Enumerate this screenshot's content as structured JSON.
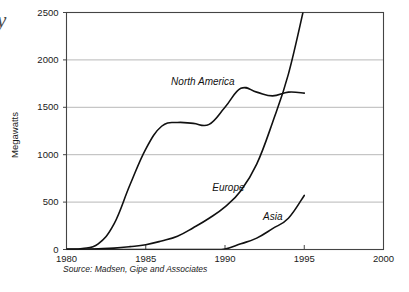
{
  "figure": {
    "edge_glyph": "y",
    "source_note": "Source: Madsen, Gipe and Associates"
  },
  "chart_data": {
    "type": "line",
    "title": "",
    "subtitle": "",
    "xlabel": "",
    "ylabel": "Megawatts",
    "xlim": [
      1980,
      2000
    ],
    "ylim": [
      0,
      2500
    ],
    "xticks": [
      1980,
      1985,
      1990,
      1995,
      2000
    ],
    "xtick_labels": [
      "1980",
      "1985",
      "1990",
      "1995",
      "2000"
    ],
    "yticks": [
      0,
      500,
      1000,
      1500,
      2000,
      2500
    ],
    "ytick_labels": [
      "0",
      "500",
      "1000",
      "1500",
      "2000",
      "2500"
    ],
    "grid": true,
    "grid_axis": "y",
    "legend": "inline-labels",
    "annotations": [
      {
        "text": "North America",
        "x": 1986.6,
        "y": 1760
      },
      {
        "text": "Europe",
        "x": 1989.2,
        "y": 640
      },
      {
        "text": "Asia",
        "x": 1992.4,
        "y": 330
      }
    ],
    "series": [
      {
        "name": "North America",
        "color": "#111111",
        "x": [
          1980,
          1981,
          1982,
          1983,
          1984,
          1985,
          1986,
          1987,
          1988,
          1989,
          1990,
          1991,
          1992,
          1993,
          1994,
          1995
        ],
        "values": [
          5,
          10,
          60,
          270,
          680,
          1060,
          1300,
          1340,
          1330,
          1320,
          1500,
          1700,
          1660,
          1620,
          1660,
          1650
        ]
      },
      {
        "name": "Europe",
        "color": "#111111",
        "x": [
          1980,
          1981,
          1982,
          1983,
          1984,
          1985,
          1986,
          1987,
          1988,
          1989,
          1990,
          1991,
          1992,
          1993,
          1994,
          1995
        ],
        "values": [
          0,
          3,
          8,
          15,
          30,
          50,
          90,
          140,
          230,
          330,
          450,
          620,
          900,
          1340,
          1850,
          2560
        ]
      },
      {
        "name": "Asia",
        "color": "#111111",
        "x": [
          1980,
          1981,
          1982,
          1983,
          1984,
          1985,
          1986,
          1987,
          1988,
          1989,
          1990,
          1991,
          1992,
          1993,
          1994,
          1995
        ],
        "values": [
          0,
          0,
          0,
          0,
          0,
          0,
          0,
          0,
          0,
          0,
          5,
          60,
          120,
          220,
          330,
          570
        ]
      }
    ]
  }
}
